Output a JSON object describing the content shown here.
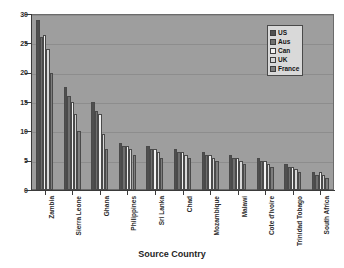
{
  "chart_data": {
    "type": "bar",
    "title": "",
    "xlabel": "Source Country",
    "ylabel": "",
    "ylim": [
      0,
      30
    ],
    "yticks": [
      0,
      5,
      10,
      15,
      20,
      25,
      30
    ],
    "grid": true,
    "legend_position": "top-right",
    "categories": [
      "Zambia",
      "Sierra Leone",
      "Ghana",
      "Philippines",
      "Sri Lanka",
      "Chad",
      "Mozambique",
      "Malawi",
      "Cote d'Ivoire",
      "Trinidad Tobago",
      "South Africa"
    ],
    "series": [
      {
        "name": "US",
        "color": "#4f4f4f",
        "values": [
          29.0,
          17.5,
          15.0,
          8.0,
          7.5,
          7.0,
          6.5,
          6.0,
          5.5,
          4.5,
          3.0
        ]
      },
      {
        "name": "Aus",
        "color": "#6f6f6f",
        "values": [
          26.0,
          16.0,
          13.5,
          7.5,
          7.0,
          6.5,
          6.0,
          5.5,
          5.0,
          4.0,
          2.5
        ]
      },
      {
        "name": "Can",
        "color": "#f2f2f2",
        "values": [
          26.5,
          15.0,
          13.0,
          7.5,
          7.0,
          6.5,
          6.0,
          5.5,
          5.0,
          4.0,
          3.0
        ]
      },
      {
        "name": "UK",
        "color": "#d8d8d8",
        "values": [
          24.0,
          13.0,
          9.5,
          7.0,
          6.5,
          6.0,
          5.5,
          5.0,
          4.5,
          3.5,
          2.5
        ]
      },
      {
        "name": "France",
        "color": "#7d7d7d",
        "values": [
          20.0,
          10.0,
          7.0,
          6.0,
          5.5,
          5.5,
          5.0,
          4.5,
          4.0,
          3.0,
          2.0
        ]
      }
    ]
  },
  "legend": {
    "items": [
      {
        "label": "US"
      },
      {
        "label": "Aus"
      },
      {
        "label": "Can"
      },
      {
        "label": "UK"
      },
      {
        "label": "France"
      }
    ]
  },
  "axis": {
    "x_title": "Source Country"
  }
}
